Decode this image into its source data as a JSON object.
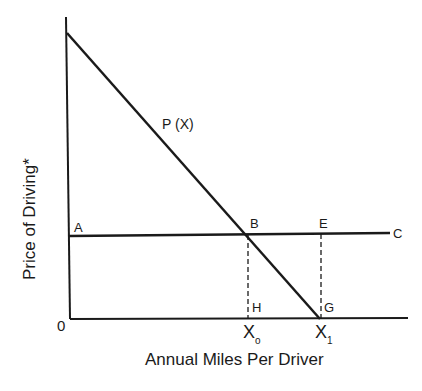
{
  "diagram": {
    "y_axis_label": "Price of Driving*",
    "x_axis_label": "Annual Miles Per Driver",
    "origin_label": "0",
    "curve_label": "P (X)",
    "points": {
      "A": "A",
      "B": "B",
      "C": "C",
      "E": "E",
      "G": "G",
      "H": "H"
    },
    "x_ticks": {
      "x0_main": "X",
      "x0_sub": "o",
      "x1_main": "X",
      "x1_sub": "1"
    },
    "colors": {
      "line": "#1a1a1a",
      "background": "#ffffff"
    }
  }
}
